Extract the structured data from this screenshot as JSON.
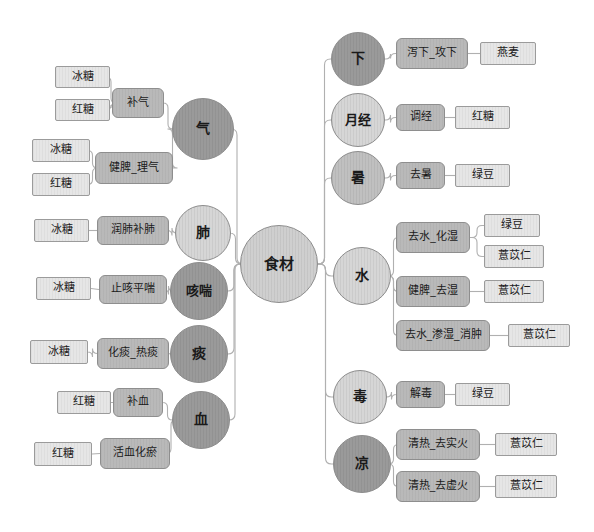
{
  "diagram": {
    "title_node": "食材",
    "type": "tree",
    "edge_color": "#b0b0b0",
    "colors": {
      "leaf_box": "#e6e6e6",
      "mid_box": "#b9b9b9",
      "circle_dark": "#9a9a9a",
      "circle_mid": "#c0c0c0",
      "circle_light": "#d6d6d6",
      "root_circle": "#cfcfcf",
      "border": "#8d8d8d"
    },
    "root": {
      "label": "食材",
      "x": 240,
      "y": 225,
      "d": 78,
      "tone": "c-root"
    },
    "left_branches": [
      {
        "circle": {
          "label": "气",
          "x": 172,
          "y": 98,
          "d": 62,
          "tone": "c-dark"
        },
        "groups": [
          {
            "label": "补气",
            "x": 112,
            "y": 88,
            "w": 52,
            "h": 30,
            "leaves": [
              {
                "label": "冰糖",
                "x": 55,
                "y": 66,
                "w": 55,
                "h": 22
              },
              {
                "label": "红糖",
                "x": 55,
                "y": 99,
                "w": 55,
                "h": 22
              }
            ]
          },
          {
            "label": "健脾_理气",
            "x": 95,
            "y": 152,
            "w": 78,
            "h": 32,
            "leaves": [
              {
                "label": "冰糖",
                "x": 32,
                "y": 139,
                "w": 58,
                "h": 23
              },
              {
                "label": "红糖",
                "x": 32,
                "y": 173,
                "w": 58,
                "h": 23
              }
            ]
          }
        ]
      },
      {
        "circle": {
          "label": "肺",
          "x": 175,
          "y": 205,
          "d": 56,
          "tone": "c-light"
        },
        "groups": [
          {
            "label": "润肺补肺",
            "x": 97,
            "y": 216,
            "w": 72,
            "h": 29,
            "leaves": [
              {
                "label": "冰糖",
                "x": 34,
                "y": 219,
                "w": 55,
                "h": 23
              }
            ]
          }
        ]
      },
      {
        "circle": {
          "label": "咳喘",
          "x": 170,
          "y": 262,
          "d": 58,
          "tone": "c-dark"
        },
        "groups": [
          {
            "label": "止咳平喘",
            "x": 99,
            "y": 275,
            "w": 68,
            "h": 29,
            "leaves": [
              {
                "label": "冰糖",
                "x": 36,
                "y": 277,
                "w": 55,
                "h": 23
              }
            ]
          }
        ]
      },
      {
        "circle": {
          "label": "痰",
          "x": 170,
          "y": 325,
          "d": 58,
          "tone": "c-dark"
        },
        "groups": [
          {
            "label": "化痰_热痰",
            "x": 97,
            "y": 338,
            "w": 72,
            "h": 31,
            "leaves": [
              {
                "label": "冰糖",
                "x": 30,
                "y": 340,
                "w": 58,
                "h": 24
              }
            ]
          }
        ]
      },
      {
        "circle": {
          "label": "血",
          "x": 172,
          "y": 391,
          "d": 58,
          "tone": "c-dark"
        },
        "groups": [
          {
            "label": "补血",
            "x": 113,
            "y": 388,
            "w": 50,
            "h": 29,
            "leaves": [
              {
                "label": "红糖",
                "x": 57,
                "y": 391,
                "w": 54,
                "h": 23
              }
            ]
          },
          {
            "label": "活血化瘀",
            "x": 100,
            "y": 438,
            "w": 70,
            "h": 31,
            "leaves": [
              {
                "label": "红糖",
                "x": 34,
                "y": 442,
                "w": 58,
                "h": 24
              }
            ]
          }
        ]
      }
    ],
    "right_branches": [
      {
        "circle": {
          "label": "下",
          "x": 331,
          "y": 32,
          "d": 54,
          "tone": "c-dark"
        },
        "groups": [
          {
            "label": "泻下_攻下",
            "x": 396,
            "y": 38,
            "w": 72,
            "h": 31,
            "leaves": [
              {
                "label": "燕麦",
                "x": 480,
                "y": 42,
                "w": 56,
                "h": 23
              }
            ]
          }
        ]
      },
      {
        "circle": {
          "label": "月经",
          "x": 331,
          "y": 93,
          "d": 54,
          "tone": "c-light"
        },
        "groups": [
          {
            "label": "调经",
            "x": 396,
            "y": 104,
            "w": 49,
            "h": 27,
            "leaves": [
              {
                "label": "红糖",
                "x": 455,
                "y": 106,
                "w": 55,
                "h": 23
              }
            ]
          }
        ]
      },
      {
        "circle": {
          "label": "暑",
          "x": 331,
          "y": 151,
          "d": 54,
          "tone": "c-mid"
        },
        "groups": [
          {
            "label": "去暑",
            "x": 396,
            "y": 162,
            "w": 49,
            "h": 27,
            "leaves": [
              {
                "label": "绿豆",
                "x": 455,
                "y": 164,
                "w": 55,
                "h": 23
              }
            ]
          }
        ]
      },
      {
        "circle": {
          "label": "水",
          "x": 333,
          "y": 247,
          "d": 58,
          "tone": "c-light"
        },
        "groups": [
          {
            "label": "去水_化湿",
            "x": 396,
            "y": 222,
            "w": 74,
            "h": 31,
            "leaves": [
              {
                "label": "绿豆",
                "x": 484,
                "y": 214,
                "w": 56,
                "h": 23
              },
              {
                "label": "薏苡仁",
                "x": 484,
                "y": 245,
                "w": 60,
                "h": 23
              }
            ]
          },
          {
            "label": "健脾_去湿",
            "x": 396,
            "y": 276,
            "w": 74,
            "h": 31,
            "leaves": [
              {
                "label": "薏苡仁",
                "x": 484,
                "y": 280,
                "w": 60,
                "h": 23
              }
            ]
          },
          {
            "label": "去水_渗湿_消肿",
            "x": 396,
            "y": 320,
            "w": 94,
            "h": 31,
            "leaves": [
              {
                "label": "薏苡仁",
                "x": 508,
                "y": 324,
                "w": 62,
                "h": 23
              }
            ]
          }
        ]
      },
      {
        "circle": {
          "label": "毒",
          "x": 333,
          "y": 370,
          "d": 54,
          "tone": "c-light"
        },
        "groups": [
          {
            "label": "解毒",
            "x": 396,
            "y": 381,
            "w": 49,
            "h": 27,
            "leaves": [
              {
                "label": "绿豆",
                "x": 455,
                "y": 383,
                "w": 55,
                "h": 23
              }
            ]
          }
        ]
      },
      {
        "circle": {
          "label": "凉",
          "x": 333,
          "y": 435,
          "d": 58,
          "tone": "c-dark"
        },
        "groups": [
          {
            "label": "清热_去实火",
            "x": 396,
            "y": 429,
            "w": 84,
            "h": 31,
            "leaves": [
              {
                "label": "薏苡仁",
                "x": 495,
                "y": 433,
                "w": 62,
                "h": 23
              }
            ]
          },
          {
            "label": "清热_去虚火",
            "x": 396,
            "y": 471,
            "w": 84,
            "h": 31,
            "leaves": [
              {
                "label": "薏苡仁",
                "x": 495,
                "y": 475,
                "w": 62,
                "h": 23
              }
            ]
          }
        ]
      }
    ]
  }
}
